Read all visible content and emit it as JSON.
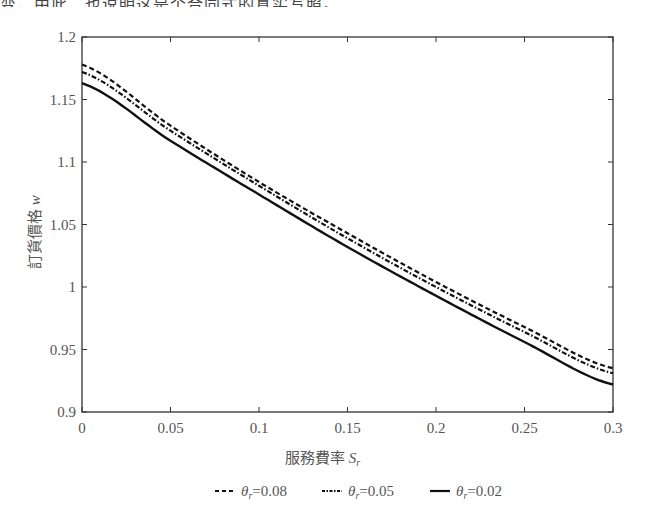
{
  "header_fragment": "变，由此，也说明这是个合同式的真实写照。",
  "chart_data": {
    "type": "line",
    "title": "",
    "xlabel": "服務費率 S_r",
    "ylabel": "訂貨價格 w",
    "xlim": [
      0,
      0.3
    ],
    "ylim": [
      0.9,
      1.2
    ],
    "xticks": [
      "0",
      "0.05",
      "0.1",
      "0.15",
      "0.2",
      "0.25",
      "0.3"
    ],
    "yticks": [
      "0.9",
      "0.95",
      "1",
      "1.05",
      "1.1",
      "1.15",
      "1.2"
    ],
    "grid": false,
    "legend_position": "bottom",
    "x": [
      0,
      0.05,
      0.1,
      0.15,
      0.2,
      0.25,
      0.3
    ],
    "series": [
      {
        "name": "θr=0.08",
        "style": "dashed",
        "values": [
          1.178,
          1.129,
          1.084,
          1.043,
          1.004,
          0.968,
          0.935
        ]
      },
      {
        "name": "θr=0.05",
        "style": "dash-dot",
        "values": [
          1.172,
          1.125,
          1.081,
          1.039,
          1.0,
          0.964,
          0.931
        ]
      },
      {
        "name": "θr=0.02",
        "style": "solid",
        "values": [
          1.163,
          1.117,
          1.074,
          1.032,
          0.993,
          0.956,
          0.922
        ]
      }
    ]
  },
  "legend": {
    "items": [
      {
        "symbol": "--",
        "theta": "θ",
        "sub": "r",
        "value": "=0.08"
      },
      {
        "symbol": "-·-",
        "theta": "θ",
        "sub": "r",
        "value": "=0.05"
      },
      {
        "symbol": "—",
        "theta": "θ",
        "sub": "r",
        "value": "=0.02"
      }
    ]
  },
  "axis": {
    "xlabel_text": "服務費率 ",
    "xlabel_var": "S",
    "xlabel_sub": "r",
    "ylabel_text": "訂貨價格 ",
    "ylabel_var": "w"
  }
}
